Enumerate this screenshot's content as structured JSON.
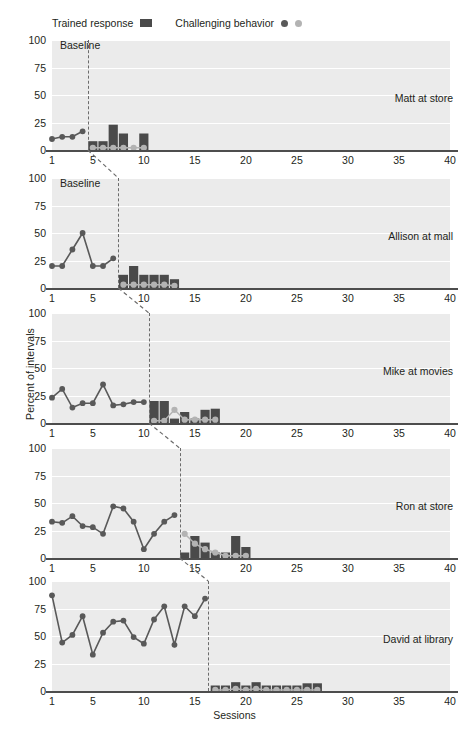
{
  "legend": {
    "trained_label": "Trained response",
    "challenging_label": "Challenging behavior",
    "trained_marker": "filled-square-icon",
    "challenging_marker_dark": "filled-circle-dark-icon",
    "challenging_marker_light": "filled-circle-light-icon",
    "colors": {
      "bar": "#4a4a4a",
      "line_dark": "#595959",
      "circle_light": "#b3b3b3",
      "plot_background": "#ebebeb",
      "gridline": "#ffffff",
      "axis": "#4d4d4d",
      "phase_line": "#6b6b6b"
    }
  },
  "axes": {
    "ylabel": "Percent of intervals",
    "xlabel": "Sessions",
    "yticks": [
      100,
      75,
      50,
      25,
      0
    ],
    "ylim": [
      0,
      100
    ],
    "xticks": [
      1,
      5,
      10,
      15,
      20,
      25,
      30,
      35,
      40
    ],
    "xlim": [
      1,
      40
    ],
    "baseline_label": "Baseline",
    "grid": "horizontal"
  },
  "chart_data": {
    "type": "line",
    "title": "",
    "subtitle": "",
    "xlabel": "Sessions",
    "ylabel": "Percent of intervals",
    "ylim": [
      0,
      100
    ],
    "xlim": [
      1,
      40
    ],
    "legend_position": "top-left",
    "design": "multiple-baseline-across-participants",
    "panels": [
      {
        "label": "Matt at store",
        "phase_change_after_session": 4.5,
        "baseline": {
          "name": "Challenging behavior",
          "x": [
            1,
            2,
            3,
            4
          ],
          "values": [
            10,
            12,
            12,
            17
          ]
        },
        "intervention_trained": {
          "name": "Trained response",
          "x": [
            5,
            6,
            7,
            8,
            9,
            10
          ],
          "values": [
            8,
            8,
            23,
            15,
            0,
            15
          ]
        },
        "intervention_challenging": {
          "name": "Challenging behavior",
          "x": [
            5,
            6,
            7,
            8,
            9,
            10
          ],
          "values": [
            2,
            2,
            2,
            2,
            2,
            2
          ]
        }
      },
      {
        "label": "Allison at mall",
        "phase_change_after_session": 7.5,
        "baseline": {
          "name": "Challenging behavior",
          "x": [
            1,
            2,
            3,
            4,
            5,
            6,
            7
          ],
          "values": [
            20,
            20,
            35,
            50,
            20,
            20,
            27
          ]
        },
        "intervention_trained": {
          "name": "Trained response",
          "x": [
            8,
            9,
            10,
            11,
            12,
            13
          ],
          "values": [
            12,
            20,
            12,
            12,
            12,
            8
          ]
        },
        "intervention_challenging": {
          "name": "Challenging behavior",
          "x": [
            8,
            9,
            10,
            11,
            12,
            13
          ],
          "values": [
            3,
            3,
            3,
            3,
            3,
            2
          ]
        }
      },
      {
        "label": "Mike at movies",
        "phase_change_after_session": 10.5,
        "baseline": {
          "name": "Challenging behavior",
          "x": [
            1,
            2,
            3,
            4,
            5,
            6,
            7,
            8,
            9,
            10
          ],
          "values": [
            23,
            31,
            14,
            18,
            18,
            35,
            16,
            17,
            19,
            19
          ]
        },
        "intervention_trained": {
          "name": "Trained response",
          "x": [
            11,
            12,
            13,
            14,
            15,
            16,
            17
          ],
          "values": [
            20,
            20,
            4,
            10,
            4,
            12,
            13
          ]
        },
        "intervention_challenging": {
          "name": "Challenging behavior",
          "x": [
            11,
            12,
            13,
            14,
            15,
            16,
            17
          ],
          "values": [
            2,
            2,
            12,
            3,
            3,
            3,
            3
          ]
        }
      },
      {
        "label": "Ron at store",
        "phase_change_after_session": 13.5,
        "baseline": {
          "name": "Challenging behavior",
          "x": [
            1,
            2,
            3,
            4,
            5,
            6,
            7,
            8,
            9,
            10,
            11,
            12,
            13
          ],
          "values": [
            33,
            32,
            38,
            29,
            28,
            22,
            47,
            45,
            33,
            8,
            22,
            33,
            39
          ]
        },
        "intervention_trained": {
          "name": "Trained response",
          "x": [
            14,
            15,
            16,
            17,
            18,
            19,
            20
          ],
          "values": [
            5,
            20,
            14,
            5,
            5,
            20,
            10
          ]
        },
        "intervention_challenging": {
          "name": "Challenging behavior",
          "x": [
            14,
            15,
            16,
            17,
            18,
            19,
            20
          ],
          "values": [
            22,
            13,
            8,
            5,
            2,
            2,
            2
          ]
        }
      },
      {
        "label": "David at library",
        "phase_change_after_session": 16.3,
        "baseline": {
          "name": "Challenging behavior",
          "x": [
            1,
            2,
            3,
            4,
            5,
            6,
            7,
            8,
            9,
            10,
            11,
            12,
            13,
            14,
            15,
            16
          ],
          "values": [
            87,
            44,
            51,
            68,
            33,
            53,
            63,
            64,
            49,
            43,
            65,
            77,
            42,
            77,
            68,
            84
          ]
        },
        "intervention_trained": {
          "name": "Trained response",
          "x": [
            17,
            18,
            19,
            20,
            21,
            22,
            23,
            24,
            25,
            26,
            27
          ],
          "values": [
            5,
            5,
            8,
            5,
            8,
            5,
            5,
            5,
            5,
            7,
            7
          ]
        },
        "intervention_challenging": {
          "name": "Challenging behavior",
          "x": [
            17,
            18,
            19,
            20,
            21,
            22,
            23,
            24,
            25,
            26,
            27
          ],
          "values": [
            1,
            1,
            2,
            1,
            2,
            1,
            1,
            1,
            1,
            1,
            1
          ]
        }
      }
    ]
  }
}
